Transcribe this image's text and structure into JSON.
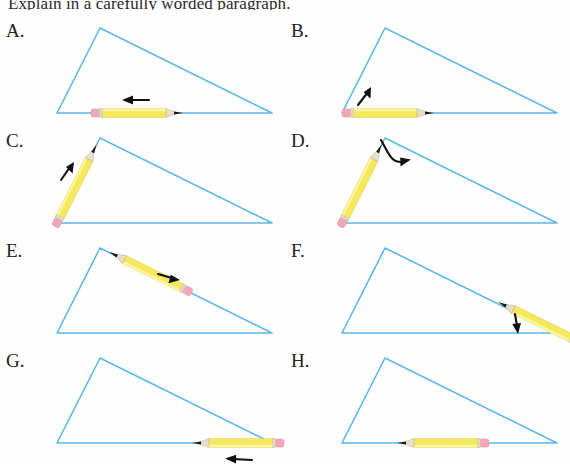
{
  "document": {
    "prompt_text": "Explain in a carefully worded paragraph.",
    "background_color": "#fefefe",
    "width": 570,
    "height": 461
  },
  "style": {
    "triangle_stroke": "#5bb8e8",
    "triangle_stroke_width": 1.6,
    "pencil_body": "#f5e85c",
    "pencil_body_light": "#faf5a0",
    "pencil_eraser": "#f4a6b8",
    "pencil_ferrule": "#e0d9c8",
    "pencil_wood": "#ddd4c0",
    "pencil_lead": "#1a1a1a",
    "arrow_color": "#111111",
    "label_color": "#222222"
  },
  "triangle": {
    "description": "obtuse scalene triangle, apex upper-left-of-center, long base, long hypotenuse to lower right",
    "apex": [
      100,
      10
    ],
    "bottom_left": [
      57,
      95
    ],
    "bottom_right": [
      272,
      95
    ]
  },
  "panels": [
    {
      "id": "A",
      "label": "A.",
      "pencil_position": "along-base-center",
      "pencil_tip_direction": "right",
      "arrow_name": "arrow-left",
      "arrow_direction": "left",
      "arrow_type": "straight"
    },
    {
      "id": "B",
      "label": "B.",
      "pencil_position": "along-base-left",
      "pencil_tip_direction": "right",
      "arrow_name": "arrow-up-right",
      "arrow_direction": "up-right",
      "arrow_type": "straight"
    },
    {
      "id": "C",
      "label": "C.",
      "pencil_position": "along-left-side",
      "pencil_tip_direction": "up-right",
      "arrow_name": "arrow-up-right",
      "arrow_direction": "up-right",
      "arrow_type": "straight"
    },
    {
      "id": "D",
      "label": "D.",
      "pencil_position": "along-left-side",
      "pencil_tip_direction": "up-right",
      "arrow_name": "arrow-rotate-clockwise",
      "arrow_direction": "clockwise-sweep",
      "arrow_type": "curved"
    },
    {
      "id": "E",
      "label": "E.",
      "pencil_position": "along-hypotenuse-upper",
      "pencil_tip_direction": "up-left",
      "arrow_name": "arrow-right",
      "arrow_direction": "right",
      "arrow_type": "straight"
    },
    {
      "id": "F",
      "label": "F.",
      "pencil_position": "along-hypotenuse-lower-right",
      "pencil_tip_direction": "up-left",
      "arrow_name": "arrow-down",
      "arrow_direction": "down",
      "arrow_type": "straight"
    },
    {
      "id": "G",
      "label": "G.",
      "pencil_position": "along-base-right",
      "pencil_tip_direction": "left",
      "arrow_name": "arrow-left",
      "arrow_direction": "left",
      "arrow_type": "straight"
    },
    {
      "id": "H",
      "label": "H.",
      "pencil_position": "along-base-center",
      "pencil_tip_direction": "left",
      "arrow_name": "none",
      "arrow_direction": "none",
      "arrow_type": "none"
    }
  ]
}
